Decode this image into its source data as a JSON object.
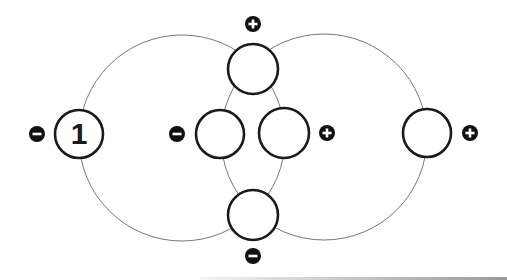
{
  "diagram": {
    "type": "circuit-loop-diagram",
    "loops": [
      {
        "id": "left-loop",
        "cx": 182,
        "cy": 138,
        "r": 103,
        "stroke": "#777777"
      },
      {
        "id": "right-loop",
        "cx": 324,
        "cy": 137,
        "r": 103,
        "stroke": "#777777"
      }
    ],
    "nodes": [
      {
        "id": "node-1",
        "label": "1",
        "cx": 79,
        "cy": 134,
        "r": 24
      },
      {
        "id": "node-top",
        "label": "",
        "cx": 253,
        "cy": 69,
        "r": 25
      },
      {
        "id": "node-inner-left",
        "label": "",
        "cx": 220,
        "cy": 134,
        "r": 24
      },
      {
        "id": "node-inner-right",
        "label": "",
        "cx": 284,
        "cy": 133,
        "r": 25
      },
      {
        "id": "node-bottom",
        "label": "",
        "cx": 253,
        "cy": 215,
        "r": 25
      },
      {
        "id": "node-right",
        "label": "",
        "cx": 427,
        "cy": 133,
        "r": 24
      }
    ],
    "badges": [
      {
        "id": "badge-node1-minus",
        "sign": "minus",
        "cx": 37,
        "cy": 134
      },
      {
        "id": "badge-top-plus",
        "sign": "plus",
        "cx": 253,
        "cy": 24
      },
      {
        "id": "badge-inner-left-minus",
        "sign": "minus",
        "cx": 177,
        "cy": 134
      },
      {
        "id": "badge-inner-right-plus",
        "sign": "plus",
        "cx": 327,
        "cy": 133
      },
      {
        "id": "badge-bottom-minus",
        "sign": "minus",
        "cx": 253,
        "cy": 256
      },
      {
        "id": "badge-right-plus",
        "sign": "plus",
        "cx": 470,
        "cy": 133
      }
    ],
    "colors": {
      "node_stroke": "#1a1a1a",
      "node_fill": "#ffffff",
      "badge_fill": "#111111",
      "badge_glyph": "#ffffff",
      "loop_stroke": "#777777"
    }
  }
}
